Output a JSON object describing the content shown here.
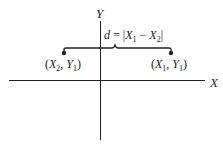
{
  "diagram": {
    "axes": {
      "x_label": "X",
      "y_label": "Y"
    },
    "distance_formula": {
      "d": "d",
      "eq": " = |",
      "X1": "X",
      "X1_sub": "1",
      "minus": " − ",
      "X2": "X",
      "X2_sub": "2",
      "close": "|"
    },
    "points": [
      {
        "name": "left-point",
        "open": "(",
        "x": "X",
        "x_sub": "2",
        "sep": ", ",
        "y": "Y",
        "y_sub": "1",
        "close": ")"
      },
      {
        "name": "right-point",
        "open": "(",
        "x": "X",
        "x_sub": "1",
        "sep": ", ",
        "y": "Y",
        "y_sub": "1",
        "close": ")"
      }
    ],
    "colors": {
      "line": "#222222",
      "background": "#ffffff"
    }
  }
}
